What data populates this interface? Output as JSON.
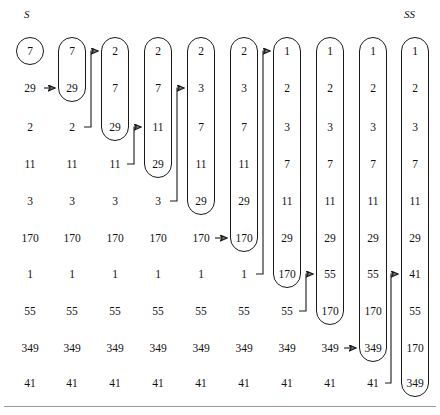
{
  "figure": {
    "title_left": "S",
    "title_right": "SS",
    "type": "insertion-sort-trace",
    "row_count": 10,
    "column_count": 10,
    "geometry": {
      "column_x": [
        30,
        72,
        115,
        158,
        201,
        244,
        287,
        330,
        373,
        415
      ],
      "row_y": [
        51,
        88,
        127,
        164,
        201,
        238,
        274,
        311,
        348,
        383
      ],
      "label_s_x": 24,
      "label_s_y": 8,
      "label_ss_x": 404,
      "label_ss_y": 8,
      "rule_y": 406,
      "capsule_width": 28,
      "capsule_radius": 14
    },
    "colors": {
      "ink": "#1a1a1a",
      "text": "#111111",
      "background": "#ffffff",
      "rule": "#9a9a9a"
    },
    "columns": [
      {
        "index": 0,
        "name": "S",
        "values": [
          "7",
          "29",
          "2",
          "11",
          "3",
          "170",
          "1",
          "55",
          "349",
          "41"
        ],
        "capsule": {
          "from": 0,
          "to": 0
        }
      },
      {
        "index": 1,
        "name": "step-1",
        "values": [
          "7",
          "29",
          "2",
          "11",
          "3",
          "170",
          "1",
          "55",
          "349",
          "41"
        ],
        "capsule": {
          "from": 0,
          "to": 1
        }
      },
      {
        "index": 2,
        "name": "step-2",
        "values": [
          "2",
          "7",
          "29",
          "11",
          "3",
          "170",
          "1",
          "55",
          "349",
          "41"
        ],
        "capsule": {
          "from": 0,
          "to": 2
        }
      },
      {
        "index": 3,
        "name": "step-3",
        "values": [
          "2",
          "7",
          "11",
          "29",
          "3",
          "170",
          "1",
          "55",
          "349",
          "41"
        ],
        "capsule": {
          "from": 0,
          "to": 3
        }
      },
      {
        "index": 4,
        "name": "step-4",
        "values": [
          "2",
          "3",
          "7",
          "11",
          "29",
          "170",
          "1",
          "55",
          "349",
          "41"
        ],
        "capsule": {
          "from": 0,
          "to": 4
        }
      },
      {
        "index": 5,
        "name": "step-5",
        "values": [
          "2",
          "3",
          "7",
          "11",
          "29",
          "170",
          "1",
          "55",
          "349",
          "41"
        ],
        "capsule": {
          "from": 0,
          "to": 5
        }
      },
      {
        "index": 6,
        "name": "step-6",
        "values": [
          "1",
          "2",
          "3",
          "7",
          "11",
          "29",
          "170",
          "55",
          "349",
          "41"
        ],
        "capsule": {
          "from": 0,
          "to": 6
        }
      },
      {
        "index": 7,
        "name": "step-7",
        "values": [
          "1",
          "2",
          "3",
          "7",
          "11",
          "29",
          "55",
          "170",
          "349",
          "41"
        ],
        "capsule": {
          "from": 0,
          "to": 7
        }
      },
      {
        "index": 8,
        "name": "step-8",
        "values": [
          "1",
          "2",
          "3",
          "7",
          "11",
          "29",
          "55",
          "170",
          "349",
          "41"
        ],
        "capsule": {
          "from": 0,
          "to": 8
        }
      },
      {
        "index": 9,
        "name": "SS",
        "values": [
          "1",
          "2",
          "3",
          "7",
          "11",
          "29",
          "41",
          "55",
          "170",
          "349"
        ],
        "capsule": {
          "from": 0,
          "to": 9
        }
      }
    ],
    "arrows": [
      {
        "name": "arrow-29-into-col1",
        "kind": "straight",
        "from_col": 0,
        "from_row": 1,
        "to_col": 1,
        "to_row": 1
      },
      {
        "name": "arrow-2-into-col2",
        "kind": "elbow",
        "from_col": 1,
        "from_row": 2,
        "to_col": 2,
        "to_row": 0
      },
      {
        "name": "arrow-11-into-col3",
        "kind": "elbow",
        "from_col": 2,
        "from_row": 3,
        "to_col": 3,
        "to_row": 2
      },
      {
        "name": "arrow-3-into-col4",
        "kind": "elbow",
        "from_col": 3,
        "from_row": 4,
        "to_col": 4,
        "to_row": 1
      },
      {
        "name": "arrow-170-into-col5",
        "kind": "straight",
        "from_col": 4,
        "from_row": 5,
        "to_col": 5,
        "to_row": 5
      },
      {
        "name": "arrow-1-into-col6",
        "kind": "elbow",
        "from_col": 5,
        "from_row": 6,
        "to_col": 6,
        "to_row": 0
      },
      {
        "name": "arrow-55-into-col7",
        "kind": "elbow",
        "from_col": 6,
        "from_row": 7,
        "to_col": 7,
        "to_row": 6
      },
      {
        "name": "arrow-349-into-col8",
        "kind": "straight",
        "from_col": 7,
        "from_row": 8,
        "to_col": 8,
        "to_row": 8
      },
      {
        "name": "arrow-41-into-col9",
        "kind": "elbow",
        "from_col": 8,
        "from_row": 9,
        "to_col": 9,
        "to_row": 6
      }
    ]
  }
}
